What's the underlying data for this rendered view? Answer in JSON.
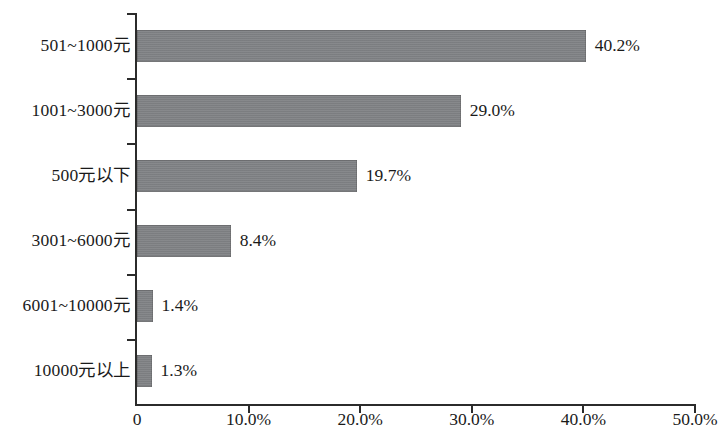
{
  "chart_data": {
    "type": "bar",
    "orientation": "horizontal",
    "title": "",
    "subtitle": "",
    "xlabel": "",
    "ylabel": "",
    "categories": [
      "501~1000元",
      "1001~3000元",
      "500元以下",
      "3001~6000元",
      "6001~10000元",
      "10000元以上"
    ],
    "values": [
      40.2,
      29.0,
      19.7,
      8.4,
      1.4,
      1.3
    ],
    "value_labels": [
      "40.2%",
      "29.0%",
      "19.7%",
      "8.4%",
      "1.4%",
      "1.3%"
    ],
    "xlim": [
      0,
      50
    ],
    "xticks": [
      0,
      10,
      20,
      30,
      40,
      50
    ],
    "xtick_labels": [
      "0",
      "10.0%",
      "20.0%",
      "30.0%",
      "40.0%",
      "50.0%"
    ],
    "grid": false,
    "legend": false,
    "bar_color": "#808285",
    "axis_color": "#2b2b2b",
    "background_color": "#ffffff"
  }
}
